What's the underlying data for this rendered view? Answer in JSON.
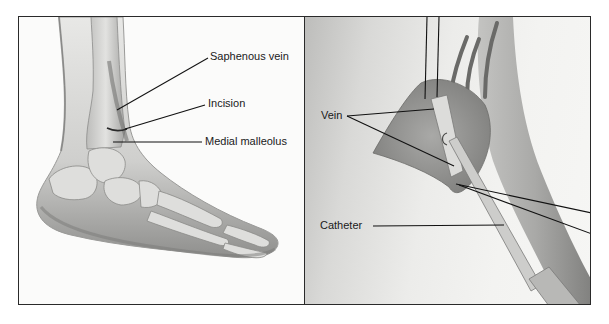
{
  "figure": {
    "panels": [
      {
        "id": "left",
        "subject": "foot-and-ankle-medial-view",
        "labels": [
          {
            "text": "Saphenous vein",
            "x": 210,
            "y": 50
          },
          {
            "text": "Incision",
            "x": 208,
            "y": 97
          },
          {
            "text": "Medial malleolus",
            "x": 205,
            "y": 135
          }
        ]
      },
      {
        "id": "right",
        "subject": "venous-cutdown-catheter-insertion",
        "labels": [
          {
            "text": "Vein",
            "x": 321,
            "y": 109
          },
          {
            "text": "Catheter",
            "x": 320,
            "y": 219
          }
        ]
      }
    ],
    "colors": {
      "frame": "#2a2a2a",
      "leader_line": "#111111",
      "label_text": "#1a1a1a",
      "tissue": "#9a9a98",
      "bone": "#d8d8d6",
      "skin_shadow": "#8c8c8a"
    }
  }
}
